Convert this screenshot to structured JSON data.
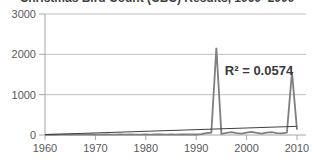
{
  "title": "Christmas Bird Count (CBC) Results, 1960–2009",
  "annotation": "R² = 0.0574",
  "colors": {
    "series": "#7f7f7f",
    "trend": "#3f3f3f",
    "gridline": "#bfbfbf",
    "axis": "#a6a6a6",
    "tick_label": "#595959",
    "title_text": "#3f3f3f"
  },
  "chart_data": {
    "type": "line",
    "title": "Christmas Bird Count (CBC) Results, 1960–2009",
    "xlabel": "",
    "ylabel": "",
    "xlim": [
      1960,
      2010
    ],
    "ylim": [
      0,
      3000
    ],
    "x_ticks": [
      1960,
      1970,
      1980,
      1990,
      2000,
      2010
    ],
    "y_ticks": [
      0,
      1000,
      2000,
      3000
    ],
    "grid": "horizontal",
    "legend": "none",
    "annotation": {
      "text": "R² = 0.0574",
      "x_px": 259,
      "y_px": 75
    },
    "series": [
      {
        "name": "CBC count",
        "color": "#7f7f7f",
        "stroke_width": 1.8,
        "x": [
          1960,
          1961,
          1962,
          1963,
          1964,
          1965,
          1966,
          1967,
          1968,
          1969,
          1970,
          1971,
          1972,
          1973,
          1974,
          1975,
          1976,
          1977,
          1978,
          1979,
          1980,
          1981,
          1982,
          1983,
          1984,
          1985,
          1986,
          1987,
          1988,
          1989,
          1990,
          1991,
          1992,
          1993,
          1994,
          1995,
          1996,
          1997,
          1998,
          1999,
          2000,
          2001,
          2002,
          2003,
          2004,
          2005,
          2006,
          2007,
          2008,
          2009,
          2010
        ],
        "values": [
          5,
          8,
          6,
          9,
          7,
          10,
          8,
          11,
          9,
          12,
          10,
          8,
          12,
          10,
          9,
          12,
          10,
          13,
          11,
          10,
          12,
          10,
          14,
          12,
          10,
          13,
          11,
          14,
          12,
          15,
          13,
          20,
          45,
          60,
          2160,
          30,
          55,
          70,
          45,
          35,
          60,
          75,
          50,
          35,
          60,
          70,
          45,
          40,
          60,
          1560,
          130
        ]
      },
      {
        "name": "linear trend",
        "color": "#3f3f3f",
        "stroke_width": 1,
        "x": [
          1960,
          2010
        ],
        "values": [
          10,
          215
        ]
      }
    ]
  }
}
